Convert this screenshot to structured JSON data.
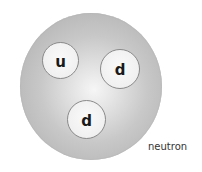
{
  "diagram": {
    "particle_label": "neutron",
    "quarks": [
      {
        "symbol": "u"
      },
      {
        "symbol": "d"
      },
      {
        "symbol": "d"
      }
    ],
    "colors": {
      "particle_edge": "#aaaaaa",
      "particle_center": "#f6f6f6",
      "quark_fill": "#f0f0f0",
      "quark_border": "#8a8a8a",
      "text": "#1a1a1a"
    }
  }
}
